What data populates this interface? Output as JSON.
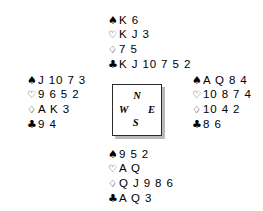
{
  "diagram": {
    "type": "bridge-deal",
    "background_color": "#ffffff",
    "text_color": "#000000"
  },
  "suits": {
    "spade": {
      "symbol": "♠",
      "name": "spades"
    },
    "heart": {
      "symbol": "♡",
      "name": "hearts"
    },
    "diamond": {
      "symbol": "♢",
      "name": "diamonds"
    },
    "club": {
      "symbol": "♣",
      "name": "clubs"
    }
  },
  "compass": {
    "north": "N",
    "west": "W",
    "east": "E",
    "south": "S",
    "border_color": "#2b2b2b",
    "shadow_color": "#b9b9b9"
  },
  "hands": {
    "north": {
      "label": "North",
      "spades": "K 6",
      "hearts": "K J 3",
      "diamonds": "7 5",
      "clubs": "K J 10 7 5 2"
    },
    "west": {
      "label": "West",
      "spades": "J 10 7 3",
      "hearts": "9 6 5 2",
      "diamonds": "A K 3",
      "clubs": "9 4"
    },
    "east": {
      "label": "East",
      "spades": "A Q 8 4",
      "hearts": "10 8 7 4",
      "diamonds": "10 4 2",
      "clubs": "8 6"
    },
    "south": {
      "label": "South",
      "spades": "9 5 2",
      "hearts": "A Q",
      "diamonds": "Q J 9 8 6",
      "clubs": "A Q 3"
    }
  }
}
